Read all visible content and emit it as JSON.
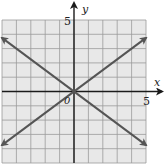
{
  "chart_data": {
    "type": "line",
    "title": "",
    "xlabel": "x",
    "ylabel": "y",
    "xlim": [
      -5,
      5
    ],
    "ylim": [
      -5,
      5
    ],
    "grid": true,
    "origin_label": "0",
    "x_tick_label": "5",
    "y_tick_label": "5",
    "series": [
      {
        "name": "line-positive-slope",
        "equation": "y = (3/4)x",
        "x": [
          -5,
          5
        ],
        "y": [
          -3.75,
          3.75
        ],
        "arrows": "both"
      },
      {
        "name": "line-negative-slope",
        "equation": "y = -(3/4)x",
        "x": [
          -5,
          5
        ],
        "y": [
          3.75,
          -3.75
        ],
        "arrows": "both"
      }
    ]
  },
  "colors": {
    "grid_bg": "#e8e8e8",
    "grid_line": "#9a9a9a",
    "axis": "#1a1a1a",
    "line": "#555555"
  }
}
